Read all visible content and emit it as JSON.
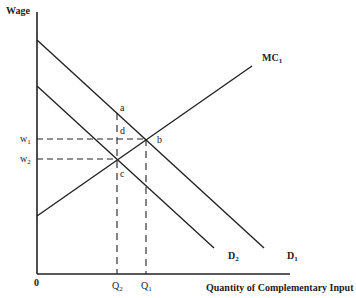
{
  "diagram": {
    "y_axis_label": "Wage",
    "x_axis_label": "Quantity of Complementary Input",
    "origin_label": "0",
    "curves": {
      "mc1": {
        "base": "MC",
        "sub": "1"
      },
      "d1": {
        "base": "D",
        "sub": "1"
      },
      "d2": {
        "base": "D",
        "sub": "2"
      }
    },
    "wage_levels": {
      "w1": {
        "base": "w",
        "sub": "1"
      },
      "w2": {
        "base": "w",
        "sub": "2"
      }
    },
    "quantities": {
      "q1": {
        "base": "Q",
        "sub": "1"
      },
      "q2": {
        "base": "Q",
        "sub": "2"
      }
    },
    "points": {
      "a": "a",
      "b": "b",
      "c": "c",
      "d": "d"
    },
    "line_color": "#222222"
  }
}
